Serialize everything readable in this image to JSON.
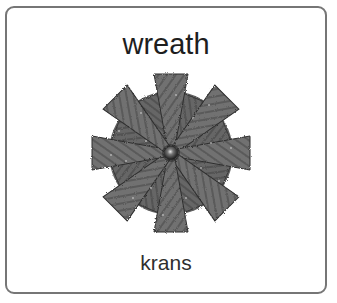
{
  "card": {
    "word": "wreath",
    "translation": "krans",
    "image": {
      "subject": "wreath-icon",
      "description": "Gray stylized wreath with radiating wedge-shaped leaves around a central dark sphere",
      "colors": {
        "leaf": "#6f6f6f",
        "leaf_dark": "#4e4e4e",
        "background_ring": "#5e5e5e",
        "center": "#2a2a2a",
        "speckle": "#c8c8c8"
      },
      "main_wedges": 8,
      "inner_wedges": 8
    },
    "border_color": "#767676"
  }
}
